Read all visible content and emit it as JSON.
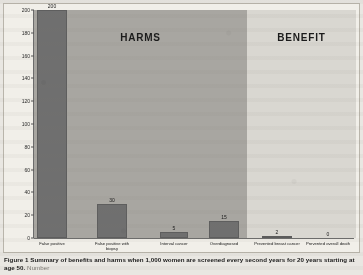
{
  "figure": {
    "caption_main": "Figure 1 Summary of benefits and harms when 1,000 women are screened every second years for 20 years starting at age 50.",
    "caption_tail": " Number"
  },
  "regions": {
    "harms_label": "HARMS",
    "benefit_label": "BENEFIT",
    "harms_color": "#a8a6a1",
    "benefit_color": "#d9d7d1"
  },
  "axis": {
    "yticks": [
      "0",
      "20",
      "40",
      "60",
      "80",
      "100",
      "120",
      "140",
      "160",
      "180",
      "200"
    ]
  },
  "chart_data": {
    "type": "bar",
    "title": "Summary of benefits and harms when 1,000 women are screened every second years for 20 years starting at age 50",
    "xlabel": "",
    "ylabel": "",
    "ylim": [
      0,
      200
    ],
    "ytick_step": 20,
    "grid": false,
    "legend": "none",
    "bar_color": "#6f6f6f",
    "categories": [
      "False positive",
      "False positive with biopsy",
      "Interval cancer",
      "Overdiagnosed",
      "Prevented breast cancer",
      "Prevented overall death"
    ],
    "values": [
      200,
      30,
      5,
      15,
      2,
      0
    ],
    "data_labels": [
      "200",
      "30",
      "5",
      "15",
      "2",
      "0"
    ],
    "groups": [
      {
        "name": "HARMS",
        "categories": [
          "False positive",
          "False positive with biopsy",
          "Interval cancer",
          "Overdiagnosed"
        ]
      },
      {
        "name": "BENEFIT",
        "categories": [
          "Prevented breast cancer",
          "Prevented overall death"
        ]
      }
    ]
  }
}
